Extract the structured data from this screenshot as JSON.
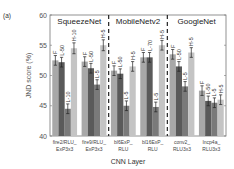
{
  "panel_label": "(a)",
  "chart_data": {
    "type": "bar",
    "title": "",
    "xlabel": "CNN Layer",
    "ylabel": "JND score (%)",
    "ylim": [
      40,
      60
    ],
    "yticks": [
      40,
      45,
      50,
      55,
      60
    ],
    "grid": false,
    "legend": null,
    "model_sections": [
      {
        "name": "SqueezeNet",
        "groups": [
          0,
          1
        ]
      },
      {
        "name": "MobileNetv2",
        "groups": [
          2,
          3
        ]
      },
      {
        "name": "GoogleNet",
        "groups": [
          4,
          5
        ]
      }
    ],
    "categories": [
      [
        "fire2/RLU_",
        "ExP3x3"
      ],
      [
        "fire9/RLU_",
        "ExP3x3"
      ],
      [
        "bl6ExP_",
        "RLU"
      ],
      [
        "bl16ExP_",
        "RLU"
      ],
      [
        "conv2_",
        "RLU3x3"
      ],
      [
        "Incp4a_",
        "RLU3x3"
      ]
    ],
    "groups": [
      {
        "bars": [
          {
            "label": "F",
            "value": 52.5,
            "err": 0.8,
            "color": "#a8a8a8"
          },
          {
            "label": "L-50",
            "value": 52.2,
            "err": 0.8,
            "color": "#5a5a5a"
          },
          {
            "label": "L-10",
            "value": 44.5,
            "err": 0.8,
            "color": "#7a7a7a"
          },
          {
            "label": "H-10",
            "value": 54.5,
            "err": 0.9,
            "color": "#c4c4c4"
          }
        ]
      },
      {
        "bars": [
          {
            "label": "F",
            "value": 52.3,
            "err": 0.8,
            "color": "#a8a8a8"
          },
          {
            "label": "L-50",
            "value": 51.2,
            "err": 0.8,
            "color": "#5a5a5a"
          },
          {
            "label": "L-5",
            "value": 48.5,
            "err": 0.8,
            "color": "#7a7a7a"
          },
          {
            "label": "H-5",
            "value": 55.0,
            "err": 0.9,
            "color": "#c4c4c4"
          }
        ]
      },
      {
        "bars": [
          {
            "label": "F",
            "value": 50.8,
            "err": 0.8,
            "color": "#a8a8a8"
          },
          {
            "label": "L-50",
            "value": 50.3,
            "err": 0.8,
            "color": "#5a5a5a"
          },
          {
            "label": "L-5",
            "value": 45.0,
            "err": 0.8,
            "color": "#7a7a7a"
          },
          {
            "label": "H-5",
            "value": 51.5,
            "err": 0.8,
            "color": "#c4c4c4"
          }
        ]
      },
      {
        "bars": [
          {
            "label": "F",
            "value": 53.0,
            "err": 0.8,
            "color": "#a8a8a8"
          },
          {
            "label": "L-70",
            "value": 53.0,
            "err": 0.8,
            "color": "#5a5a5a"
          },
          {
            "label": "L-5",
            "value": 44.8,
            "err": 0.8,
            "color": "#7a7a7a"
          },
          {
            "label": "H-5",
            "value": 55.0,
            "err": 0.8,
            "color": "#c4c4c4"
          }
        ]
      },
      {
        "bars": [
          {
            "label": "F",
            "value": 53.5,
            "err": 0.8,
            "color": "#a8a8a8"
          },
          {
            "label": "L-50",
            "value": 51.5,
            "err": 0.8,
            "color": "#5a5a5a"
          },
          {
            "label": "L-5",
            "value": 48.2,
            "err": 0.8,
            "color": "#7a7a7a"
          },
          {
            "label": "H-5",
            "value": 53.8,
            "err": 0.8,
            "color": "#c4c4c4"
          }
        ]
      },
      {
        "bars": [
          {
            "label": "F",
            "value": 47.5,
            "err": 0.8,
            "color": "#a8a8a8"
          },
          {
            "label": "L-50",
            "value": 45.8,
            "err": 0.8,
            "color": "#5a5a5a"
          },
          {
            "label": "L-5",
            "value": 45.5,
            "err": 0.8,
            "color": "#7a7a7a"
          },
          {
            "label": "H-5",
            "value": 46.0,
            "err": 0.8,
            "color": "#c4c4c4"
          }
        ]
      }
    ]
  }
}
